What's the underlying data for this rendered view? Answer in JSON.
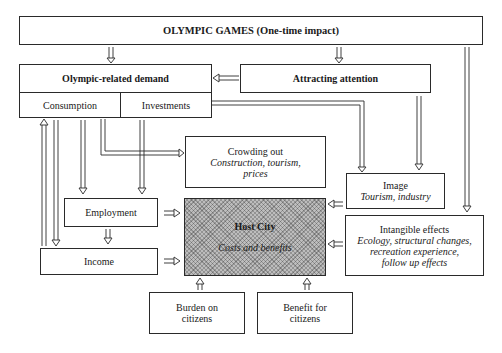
{
  "diagram": {
    "olympic_games": {
      "title": "OLYMPIC GAMES (One-time impact)"
    },
    "olympic_demand": {
      "title": "Olympic-related demand",
      "consumption": "Consumption",
      "investments": "Investments"
    },
    "attracting_attention": {
      "title": "Attracting attention"
    },
    "crowding_out": {
      "title": "Crowding out",
      "detail_1": "Construction, tourism,",
      "detail_2": "prices"
    },
    "image": {
      "title": "Image",
      "detail": "Tourism, industry"
    },
    "employment": {
      "title": "Employment"
    },
    "income": {
      "title": "Income"
    },
    "host_city": {
      "title": "Host City",
      "detail": "Costs and benefits"
    },
    "intangible_effects": {
      "title": "Intangible effects",
      "detail_1": "Ecology, structural changes,",
      "detail_2": "recreation experience,",
      "detail_3": "follow up effects"
    },
    "burden": {
      "line_1": "Burden on",
      "line_2": "citizens"
    },
    "benefit": {
      "line_1": "Benefit for",
      "line_2": "citizens"
    }
  },
  "colors": {
    "line": "#2a2a2a",
    "hatch": "#bdbdbd",
    "background": "#ffffff"
  }
}
